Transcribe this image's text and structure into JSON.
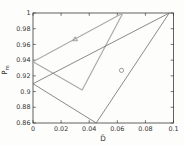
{
  "figure": {
    "background": "#fdfdfb",
    "axis_color": "#3a3a38",
    "tick_label_color": "#333331"
  },
  "chart_data": {
    "type": "line",
    "title": "",
    "xlabel": "D̄",
    "ylabel_main": "P",
    "ylabel_sub": "m",
    "xlim": [
      0,
      0.1
    ],
    "ylim": [
      0.86,
      1
    ],
    "x_ticks": [
      0,
      0.02,
      0.04,
      0.06,
      0.08,
      0.1
    ],
    "x_tick_labels": [
      "0",
      "0.02",
      "0.04",
      "0.06",
      "0.08",
      "0.1"
    ],
    "y_ticks": [
      0.86,
      0.88,
      0.9,
      0.92,
      0.94,
      0.96,
      0.98,
      1
    ],
    "y_tick_labels": [
      "0.86",
      "0.88",
      "0.9",
      "0.92",
      "0.94",
      "0.96",
      "0.98",
      "1"
    ],
    "grid": false,
    "legend": "none",
    "series": [
      {
        "name": "triangle-marked-region",
        "color": "#adada7",
        "line_width": 1.25,
        "points": [
          [
            0,
            0.938
          ],
          [
            0.064,
            1.0
          ],
          [
            0.035,
            0.902
          ],
          [
            0,
            0.938
          ]
        ]
      },
      {
        "name": "circle-marked-region",
        "color": "#6c6c6a",
        "line_width": 0.8,
        "points": [
          [
            0,
            0.91
          ],
          [
            0.097,
            1.0
          ],
          [
            0.045,
            0.86
          ],
          [
            0,
            0.91
          ]
        ]
      }
    ],
    "annotations": [
      {
        "marker": "triangle",
        "color": "#8a8a86",
        "x": 0.03,
        "y": 0.967
      },
      {
        "marker": "circle",
        "color": "#82827e",
        "x": 0.063,
        "y": 0.927
      }
    ]
  }
}
